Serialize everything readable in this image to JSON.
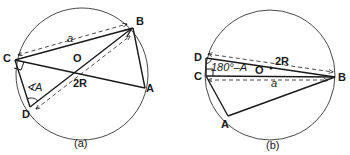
{
  "figure_a": {
    "caption": "(a)",
    "points": {
      "A": "A",
      "B": "B",
      "C": "C",
      "D": "D",
      "O": "O"
    },
    "labels": {
      "side": "a",
      "diameter": "2R",
      "angle": "∢A"
    }
  },
  "figure_b": {
    "caption": "(b)",
    "points": {
      "A": "A",
      "B": "B",
      "C": "C",
      "D": "D",
      "O": "O"
    },
    "labels": {
      "side": "a",
      "diameter": "2R",
      "angle": "180°–A"
    }
  },
  "colors": {
    "stroke": "#1a1a1a",
    "background": "#ffffff"
  }
}
